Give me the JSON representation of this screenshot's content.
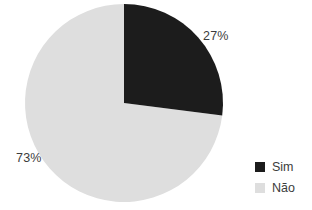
{
  "chart_data": {
    "type": "pie",
    "title": "",
    "categories": [
      "Sim",
      "Não"
    ],
    "values": [
      27,
      73
    ],
    "value_unit": "%",
    "data_labels": [
      "27%",
      "73%"
    ],
    "colors": [
      "#1c1c1c",
      "#dedede"
    ],
    "start_angle_deg": 0,
    "direction": "clockwise",
    "legend_position": "right",
    "grid": false,
    "background": "#ffffff",
    "label_color": "#3c3c3c"
  },
  "labels": {
    "sim_pct": "27%",
    "nao_pct": "73%"
  },
  "legend": {
    "items": [
      {
        "label": "Sim",
        "color": "#1c1c1c",
        "value": 27
      },
      {
        "label": "Não",
        "color": "#dedede",
        "value": 73
      }
    ]
  },
  "geometry": {
    "center_x": 124,
    "center_y": 103,
    "radius": 99
  }
}
